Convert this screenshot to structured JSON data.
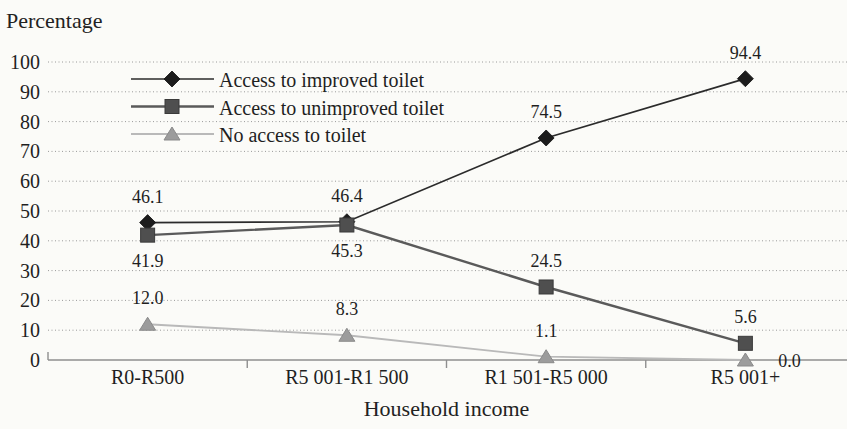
{
  "figure": {
    "background": "#fbfbf8"
  },
  "chart_data": {
    "type": "line",
    "title": "",
    "ylabel": "Percentage",
    "xlabel": "Household income",
    "categories": [
      "R0-R500",
      "R5 001-R1 500",
      "R1 501-R5 000",
      "R5 001+"
    ],
    "y_ticks": [
      0,
      10,
      20,
      30,
      40,
      50,
      60,
      70,
      80,
      90,
      100
    ],
    "ylim": [
      0,
      100
    ],
    "grid": "horizontal-dotted",
    "legend_position": "top-left-inside",
    "colors": {
      "grid": "#9a9a9a",
      "axis": "#8f8f8f",
      "text": "#1f1f1f"
    },
    "series": [
      {
        "name": "Access to improved toilet",
        "marker": "diamond",
        "color": "#1c1c1c",
        "line_color": "#2b2b2b",
        "values": [
          46.1,
          46.4,
          74.5,
          94.4
        ],
        "labels": [
          "46.1",
          "46.4",
          "74.5",
          "94.4"
        ],
        "label_placement": [
          "above",
          "above",
          "above",
          "above"
        ]
      },
      {
        "name": "Access to unimproved toilet",
        "marker": "square",
        "color": "#4f4f4f",
        "line_color": "#5a5a5a",
        "values": [
          41.9,
          45.3,
          24.5,
          5.6
        ],
        "labels": [
          "41.9",
          "45.3",
          "24.5",
          "5.6"
        ],
        "label_placement": [
          "below",
          "below",
          "above",
          "above"
        ]
      },
      {
        "name": "No access to toilet",
        "marker": "triangle",
        "color": "#9c9c9c",
        "line_color": "#b9b9b9",
        "values": [
          12.0,
          8.3,
          1.1,
          0.0
        ],
        "labels": [
          "12.0",
          "8.3",
          "1.1",
          "0.0"
        ],
        "label_placement": [
          "above",
          "above",
          "above",
          "right"
        ]
      }
    ]
  }
}
